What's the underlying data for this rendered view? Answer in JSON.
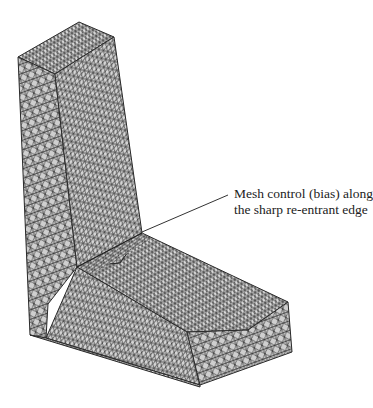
{
  "figure": {
    "background_color": "#ffffff",
    "mesh_fill_color": "#d4d4d4",
    "mesh_line_color": "#2a2a2a"
  },
  "annotation": {
    "line1": "Mesh control (bias) along",
    "line2": "the sharp re-entrant edge",
    "leader_color": "#333333"
  }
}
